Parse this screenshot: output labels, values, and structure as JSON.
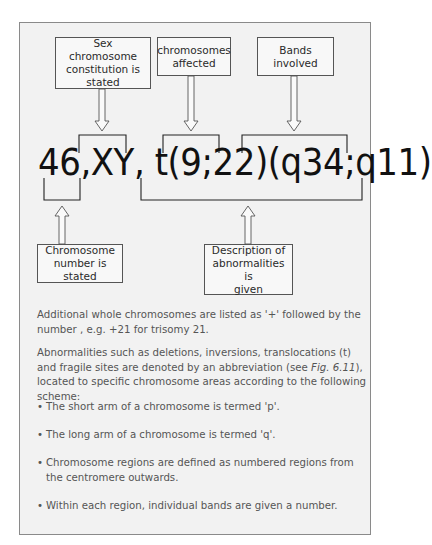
{
  "diagram": {
    "top_labels": [
      {
        "id": "sex",
        "text": "Sex chromosome\nconstitution is\nstated"
      },
      {
        "id": "chrom",
        "text": "chromosomes\naffected"
      },
      {
        "id": "bands",
        "text": "Bands\ninvolved"
      }
    ],
    "formula": "46,XY, t(9;22)(q34;q11)",
    "bottom_labels": [
      {
        "id": "number",
        "text": "Chromosome\nnumber is stated"
      },
      {
        "id": "desc",
        "text": "Description of\nabnormalities is\ngiven"
      }
    ]
  },
  "text": {
    "para1": "Additional whole chromosomes are listed as '+' followed by the number , e.g. +21 for trisomy 21.",
    "para2_before": "Abnormalities such as deletions, inversions, translocations (t) and fragile sites are denoted by an abbreviation (see ",
    "para2_ref": "Fig. 6.11",
    "para2_after": "), located to specific chromosome areas according to the following scheme:",
    "bullet_char": "•",
    "bullets": [
      "The short arm of a chromosome is termed 'p'.",
      "The long arm of a chromosome is termed 'q'.",
      "Chromosome regions are defined as numbered regions from the centromere outwards.",
      "Within each region, individual bands are given a number."
    ]
  },
  "colors": {
    "frame_bg": "#f2f2f2",
    "frame_border": "#8a8a8a",
    "line": "#222222",
    "text": "#555555"
  }
}
